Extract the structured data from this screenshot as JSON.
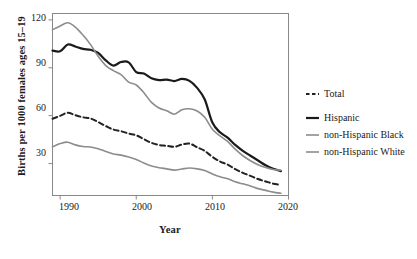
{
  "chart_data": {
    "type": "line",
    "title": "",
    "xlabel": "Year",
    "ylabel": "Births per 1000 females ages 15–19",
    "xlim": [
      1989,
      2020
    ],
    "ylim": [
      10,
      124
    ],
    "xticks": [
      1990,
      2000,
      2010,
      2020
    ],
    "yticks": [
      30,
      60,
      90,
      120
    ],
    "grid": false,
    "legend_position": "right",
    "x": [
      1989,
      1990,
      1991,
      1992,
      1993,
      1994,
      1995,
      1996,
      1997,
      1998,
      1999,
      2000,
      2001,
      2002,
      2003,
      2004,
      2005,
      2006,
      2007,
      2008,
      2009,
      2010,
      2011,
      2012,
      2013,
      2014,
      2015,
      2016,
      2017,
      2018,
      2019
    ],
    "series": [
      {
        "name": "Total",
        "style": "dashed",
        "color": "#222222",
        "width": 2.0,
        "values": [
          58.1,
          59.9,
          61.8,
          60.3,
          59.0,
          58.2,
          56.0,
          53.5,
          51.3,
          50.3,
          48.8,
          47.7,
          45.3,
          43.0,
          41.6,
          41.1,
          40.5,
          41.9,
          42.5,
          40.2,
          37.9,
          34.2,
          31.3,
          29.4,
          26.5,
          24.2,
          22.3,
          20.3,
          18.8,
          17.4,
          16.7
        ]
      },
      {
        "name": "Hispanic",
        "style": "solid",
        "color": "#1a1a1a",
        "width": 2.2,
        "values": [
          100.8,
          100.3,
          104.6,
          103.3,
          101.8,
          101.3,
          99.3,
          94.6,
          91.4,
          93.6,
          93.4,
          87.3,
          86.4,
          83.4,
          82.3,
          82.6,
          81.7,
          83.0,
          81.8,
          77.4,
          70.1,
          55.7,
          49.6,
          46.3,
          41.7,
          38.0,
          34.9,
          31.9,
          28.9,
          26.7,
          25.3
        ]
      },
      {
        "name": "non-Hispanic Black",
        "style": "solid",
        "color": "#8c8c8c",
        "width": 1.6,
        "values": [
          113.8,
          116.2,
          118.2,
          115.5,
          110.5,
          104.5,
          97.2,
          91.4,
          88.2,
          85.7,
          81.0,
          79.2,
          74.4,
          68.3,
          64.8,
          63.1,
          60.9,
          63.7,
          64.3,
          62.9,
          59.0,
          51.5,
          47.3,
          43.9,
          39.0,
          34.9,
          31.8,
          29.3,
          27.5,
          26.3,
          25.8
        ]
      },
      {
        "name": "non-Hispanic White",
        "style": "solid",
        "color": "#8c8c8c",
        "width": 1.6,
        "values": [
          40.5,
          42.5,
          43.4,
          41.7,
          40.7,
          40.4,
          39.3,
          37.6,
          36.0,
          35.3,
          34.1,
          32.6,
          30.3,
          28.5,
          27.4,
          26.7,
          25.9,
          26.6,
          27.2,
          26.7,
          25.6,
          23.5,
          21.7,
          20.5,
          18.6,
          17.3,
          16.0,
          14.3,
          13.2,
          12.1,
          11.4
        ]
      }
    ]
  },
  "axes": {
    "x_title": "Year",
    "y_title": "Births per 1000 females ages 15–19",
    "x_tick_labels": [
      "1990",
      "2000",
      "2010",
      "2020"
    ],
    "y_tick_labels": [
      "30",
      "60",
      "90",
      "120"
    ]
  },
  "legend": {
    "entries": [
      {
        "label": "Total",
        "color": "#222222",
        "style": "dashed"
      },
      {
        "label": "Hispanic",
        "color": "#1a1a1a",
        "style": "solid"
      },
      {
        "label": "non-Hispanic Black",
        "color": "#8c8c8c",
        "style": "solid"
      },
      {
        "label": "non-Hispanic White",
        "color": "#8c8c8c",
        "style": "solid"
      }
    ]
  },
  "colors": {
    "frame": "#888888",
    "background": "#ffffff",
    "text": "#1a1a1a"
  }
}
